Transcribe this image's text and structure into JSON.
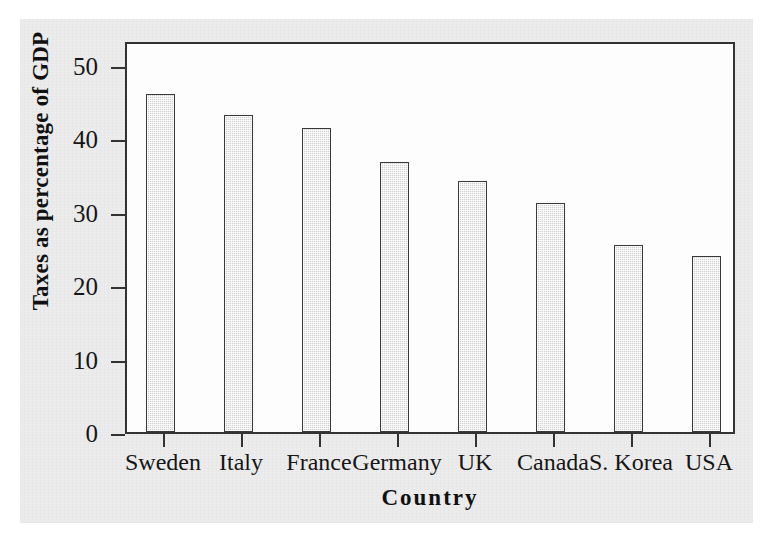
{
  "chart_data": {
    "type": "bar",
    "title": "",
    "xlabel": "Country",
    "ylabel": "Taxes as percentage of GDP",
    "categories": [
      "Sweden",
      "Italy",
      "France",
      "Germany",
      "UK",
      "Canada",
      "S. Korea",
      "USA"
    ],
    "values": [
      46.2,
      43.3,
      41.5,
      36.9,
      34.3,
      31.3,
      25.6,
      24.0
    ],
    "ylim": [
      0,
      53
    ],
    "yticks": [
      0,
      10,
      20,
      30,
      40,
      50
    ],
    "ytick_labels": [
      "0",
      "10",
      "20",
      "30",
      "40",
      "50"
    ],
    "grid": false,
    "legend": "none",
    "bar_fill_color": "#cfcfcf",
    "bar_border_color": "#3a3a3a",
    "axis_color": "#333333",
    "panel_background": "#ececec",
    "plot_background": "#fdfdfd"
  }
}
